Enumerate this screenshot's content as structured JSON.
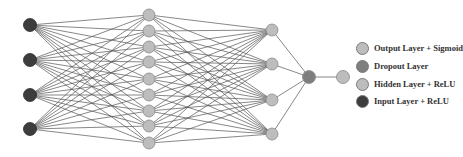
{
  "diagram": {
    "title": "",
    "colors": {
      "input": "#3d3d3d",
      "hidden": "#bdbdbd",
      "dropout": "#7e7e7e",
      "output": "#bdbdbd",
      "edge": "#555555",
      "node_stroke": "#8a8a8a"
    },
    "layers": [
      {
        "name": "input",
        "x": 30,
        "ys": [
          25,
          60,
          95,
          129
        ],
        "r": 6.5,
        "color_key": "input"
      },
      {
        "name": "hidden1",
        "x": 149,
        "ys": [
          15,
          31,
          47,
          62,
          79,
          95,
          111,
          126,
          143
        ],
        "r": 6,
        "color_key": "hidden"
      },
      {
        "name": "hidden2",
        "x": 272,
        "ys": [
          30,
          64,
          100,
          134
        ],
        "r": 6,
        "color_key": "hidden"
      },
      {
        "name": "dropout",
        "x": 309,
        "ys": [
          77
        ],
        "r": 6.5,
        "color_key": "dropout"
      },
      {
        "name": "output",
        "x": 343,
        "ys": [
          77
        ],
        "r": 6.5,
        "color_key": "output"
      }
    ],
    "connections": [
      {
        "from": 0,
        "to": 1,
        "type": "full"
      },
      {
        "from": 1,
        "to": 2,
        "type": "full"
      },
      {
        "from": 2,
        "to": 3,
        "type": "full"
      },
      {
        "from": 3,
        "to": 4,
        "type": "full"
      }
    ]
  },
  "legend": {
    "items": [
      {
        "label": "Output Layer + Sigmoid",
        "color": "#bdbdbd",
        "y": 8
      },
      {
        "label": "Dropout Layer",
        "color": "#7e7e7e",
        "y": 26
      },
      {
        "label": "Hidden Layer + ReLU",
        "color": "#bdbdbd",
        "y": 44
      },
      {
        "label": "Input Layer + ReLU",
        "color": "#3d3d3d",
        "y": 61
      }
    ]
  }
}
